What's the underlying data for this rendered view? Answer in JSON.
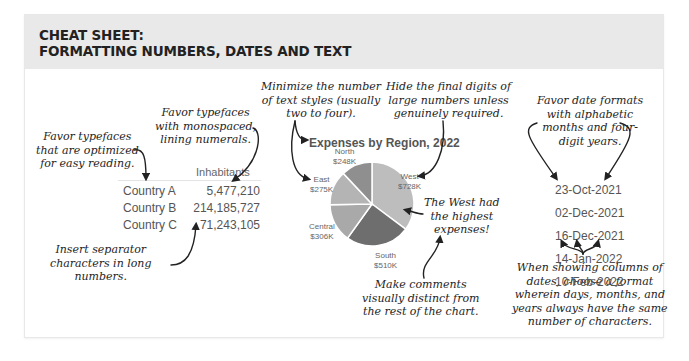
{
  "header": {
    "title_line1": "CHEAT SHEET:",
    "title_line2": "FORMATTING NUMBERS, DATES AND TEXT"
  },
  "notes": {
    "readable_typefaces": "Favor typefaces\nthat are optimized\nfor easy reading.",
    "monospaced": "Favor typefaces\nwith monospaced,\nlining numerals.",
    "separators": "Insert separator\ncharacters in long\nnumbers.",
    "text_styles": "Minimize the number\nof text styles (usually\ntwo to four).",
    "hide_digits": "Hide the final digits of\nlarge numbers unless\ngenuinely required.",
    "west_comment": "The West had\nthe highest\nexpenses!",
    "comments_distinct": "Make comments\nvisually distinct from\nthe rest of the chart.",
    "date_formats": "Favor date formats\nwith alphabetic\nmonths and four-\ndigit years.",
    "date_columns": "When showing columns of\ndates, choose a format\nwherein days, months, and\nyears always have the same\nnumber of characters."
  },
  "table": {
    "header": "Inhabitants",
    "rows": [
      {
        "label": "Country A",
        "value": "5,477,210"
      },
      {
        "label": "Country B",
        "value": "214,185,727"
      },
      {
        "label": "Country C",
        "value": "71,243,105"
      }
    ]
  },
  "chart_data": {
    "type": "pie",
    "title": "Expenses by Region, 2022",
    "categories": [
      "West",
      "South",
      "Central",
      "East",
      "North"
    ],
    "values": [
      728,
      510,
      306,
      275,
      248
    ],
    "unit": "$K",
    "labels": [
      "$728K",
      "$510K",
      "$306K",
      "$275K",
      "$248K"
    ],
    "colors": [
      "#bdbdbd",
      "#6e6e6e",
      "#a9a9a9",
      "#b4b4b4",
      "#8f8f8f"
    ],
    "start_angle_deg": 0,
    "direction": "clockwise"
  },
  "dates": [
    "23-Oct-2021",
    "02-Dec-2021",
    "16-Dec-2021",
    "14-Jan-2022",
    "10-Feb-2022"
  ]
}
